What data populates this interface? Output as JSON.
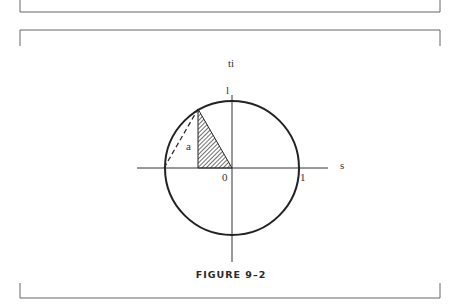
{
  "figure": {
    "caption": "FIGURE 9–2",
    "axis_labels": {
      "vertical": "ti",
      "horizontal": "s"
    },
    "point_labels": {
      "top_intercept": "l",
      "origin": "0",
      "right_intercept": "1",
      "segment": "a"
    }
  }
}
